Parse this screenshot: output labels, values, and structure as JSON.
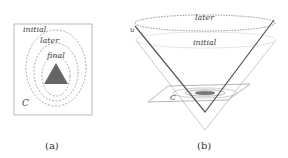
{
  "panel_a": {
    "caption": "(a)",
    "labels": {
      "initial": "initial",
      "later": "later",
      "final": "final",
      "region": "C"
    }
  },
  "panel_b": {
    "caption": "(b)",
    "labels": {
      "later": "later",
      "initial": "initial",
      "cone": "u",
      "region": "C"
    }
  },
  "colors": {
    "frame": "#999999",
    "dashed": "#777777",
    "triangle": "#666666",
    "cone_dark": "#555555",
    "cone_light": "#c8c8c8"
  }
}
